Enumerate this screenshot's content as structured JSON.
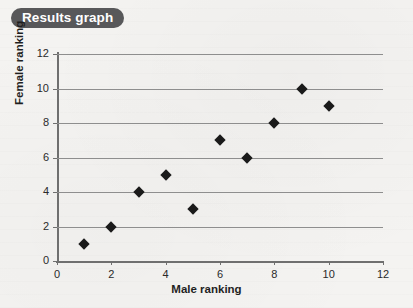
{
  "title": {
    "label": "Results graph"
  },
  "colors": {
    "badge_background": "#58585a",
    "badge_text": "#ffffff",
    "plot_background": "#f4f3f1",
    "gridline": "#8e8e8e",
    "axis": "#6f6f6f",
    "marker": "#1a1a1a",
    "text": "#1f1f1f"
  },
  "chart_data": {
    "type": "scatter",
    "title": "Results graph",
    "xlabel": "Male ranking",
    "ylabel": "Female ranking",
    "xlim": [
      0,
      12
    ],
    "ylim": [
      0,
      12
    ],
    "xticks": [
      0,
      2,
      4,
      6,
      8,
      10,
      12
    ],
    "yticks": [
      0,
      2,
      4,
      6,
      8,
      10,
      12
    ],
    "xtick_labels": [
      "0",
      "2",
      "4",
      "6",
      "8",
      "10",
      "12"
    ],
    "ytick_labels": [
      "0",
      "2",
      "4",
      "6",
      "8",
      "10",
      "12"
    ],
    "grid": "horizontal",
    "legend": "none",
    "marker_shape": "diamond",
    "series": [
      {
        "name": "Rankings",
        "points": [
          {
            "x": 1,
            "y": 1
          },
          {
            "x": 2,
            "y": 2
          },
          {
            "x": 3,
            "y": 4
          },
          {
            "x": 4,
            "y": 5
          },
          {
            "x": 5,
            "y": 3
          },
          {
            "x": 6,
            "y": 7
          },
          {
            "x": 7,
            "y": 6
          },
          {
            "x": 8,
            "y": 8
          },
          {
            "x": 9,
            "y": 10
          },
          {
            "x": 10,
            "y": 9
          }
        ]
      }
    ]
  }
}
